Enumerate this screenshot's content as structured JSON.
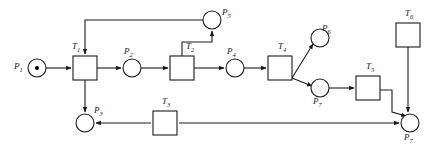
{
  "diagram": {
    "type": "petri-net",
    "width": 435,
    "height": 152,
    "stroke_color": "#1a1a1a",
    "fill_color": "#ffffff",
    "token_color": "#000000"
  },
  "places": [
    {
      "id": "p1",
      "label": "P",
      "sub": "1",
      "cx": 37,
      "cy": 68,
      "r": 9,
      "tokens": 1,
      "label_x": 14,
      "label_y": 62
    },
    {
      "id": "p2",
      "label": "P",
      "sub": "2",
      "cx": 132,
      "cy": 68,
      "r": 9,
      "tokens": 0,
      "label_x": 124,
      "label_y": 47
    },
    {
      "id": "p5",
      "label": "P",
      "sub": "5",
      "cx": 212,
      "cy": 20,
      "r": 9,
      "tokens": 0,
      "label_x": 222,
      "label_y": 8
    },
    {
      "id": "p4",
      "label": "P",
      "sub": "4",
      "cx": 235,
      "cy": 68,
      "r": 9,
      "tokens": 0,
      "label_x": 227,
      "label_y": 47
    },
    {
      "id": "p6",
      "label": "P",
      "sub": "6",
      "cx": 320,
      "cy": 38,
      "r": 9,
      "tokens": 0,
      "label_x": 322,
      "label_y": 24
    },
    {
      "id": "p7",
      "label": "P",
      "sub": "7",
      "cx": 320,
      "cy": 88,
      "r": 9,
      "tokens": 0,
      "label_x": 313,
      "label_y": 97
    },
    {
      "id": "p3",
      "label": "P",
      "sub": "3",
      "cx": 85,
      "cy": 123,
      "r": 9,
      "tokens": 0,
      "label_x": 94,
      "label_y": 106
    },
    {
      "id": "p7b",
      "label": "P",
      "sub": "7",
      "cx": 410,
      "cy": 123,
      "r": 9,
      "tokens": 0,
      "label_x": 404,
      "label_y": 133
    }
  ],
  "transitions": [
    {
      "id": "t1",
      "label": "T",
      "sub": "1",
      "x": 73,
      "y": 56,
      "w": 24,
      "h": 24,
      "label_x": 72,
      "label_y": 42
    },
    {
      "id": "t2",
      "label": "T",
      "sub": "2",
      "x": 170,
      "y": 56,
      "w": 24,
      "h": 24,
      "label_x": 186,
      "label_y": 42
    },
    {
      "id": "t4",
      "label": "T",
      "sub": "4",
      "x": 268,
      "y": 56,
      "w": 24,
      "h": 24,
      "label_x": 278,
      "label_y": 42
    },
    {
      "id": "t5",
      "label": "T",
      "sub": "5",
      "x": 356,
      "y": 76,
      "w": 24,
      "h": 24,
      "label_x": 366,
      "label_y": 62
    },
    {
      "id": "t6",
      "label": "T",
      "sub": "6",
      "x": 396,
      "y": 23,
      "w": 24,
      "h": 24,
      "label_x": 405,
      "label_y": 9
    },
    {
      "id": "t3",
      "label": "T",
      "sub": "3",
      "x": 153,
      "y": 111,
      "w": 24,
      "h": 24,
      "label_x": 162,
      "label_y": 97
    }
  ],
  "arcs": [
    {
      "id": "p1-t1",
      "from": "p1",
      "to": "t1",
      "path": "M46,68 L71,68"
    },
    {
      "id": "t1-p2",
      "from": "t1",
      "to": "p2",
      "path": "M97,68 L121,68"
    },
    {
      "id": "p2-t2",
      "from": "p2",
      "to": "t2",
      "path": "M141,68 L168,68"
    },
    {
      "id": "t2-p4",
      "from": "t2",
      "to": "p4",
      "path": "M194,68 L224,68"
    },
    {
      "id": "p4-t4",
      "from": "p4",
      "to": "t4",
      "path": "M244,68 L266,68"
    },
    {
      "id": "t4-p6",
      "from": "t4",
      "to": "p6",
      "path": "M292,78 L313,44"
    },
    {
      "id": "t4-p7",
      "from": "t4",
      "to": "p7",
      "path": "M292,78 L312,86"
    },
    {
      "id": "p7-t5",
      "from": "p7",
      "to": "t5",
      "path": "M329,88 L354,88"
    },
    {
      "id": "t2-p5",
      "from": "t2",
      "to": "p5",
      "path": "M182,56 L182,42 L212,42 L212,31"
    },
    {
      "id": "p5-t1",
      "from": "p5",
      "to": "t1",
      "path": "M203,20 L85,20 L85,54"
    },
    {
      "id": "t1-p3",
      "from": "t1",
      "to": "p3",
      "path": "M85,80 L85,112"
    },
    {
      "id": "t3-p3",
      "from": "t3",
      "to": "p3",
      "path": "M151,123 L96,123"
    },
    {
      "id": "t3-p7b",
      "from": "t3",
      "to": "p7b",
      "path": "M179,123 L399,123"
    },
    {
      "id": "t5-p7b",
      "from": "t5",
      "to": "p7b",
      "path": "M380,90 L392,90 L392,112 L406,116"
    },
    {
      "id": "t6-p7b",
      "from": "t6",
      "to": "p7b",
      "path": "M408,47 L408,112"
    }
  ]
}
